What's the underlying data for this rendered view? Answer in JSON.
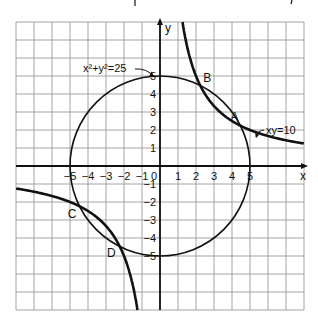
{
  "chart_data": {
    "type": "line",
    "title": "",
    "xlabel": "x",
    "ylabel": "y",
    "xlim": [
      -8,
      8
    ],
    "ylim": [
      -8,
      8
    ],
    "grid": true,
    "x_ticks": [
      "-5",
      "-4",
      "-3",
      "-2",
      "-1",
      "0",
      "1",
      "2",
      "3",
      "4",
      "5"
    ],
    "y_ticks": [
      "5",
      "4",
      "3",
      "2",
      "1",
      "-1",
      "-2",
      "-3",
      "-4",
      "-5"
    ],
    "series": [
      {
        "name": "x² + y² = 25",
        "kind": "circle",
        "center": [
          0,
          0
        ],
        "radius": 5
      },
      {
        "name": "xy = 10",
        "kind": "hyperbola",
        "k": 10
      }
    ],
    "annotations": [
      {
        "label": "A",
        "x": 4.47,
        "y": 2.24
      },
      {
        "label": "B",
        "x": 2.24,
        "y": 4.47
      },
      {
        "label": "C",
        "x": -4.47,
        "y": -2.24
      },
      {
        "label": "D",
        "x": -2.24,
        "y": -4.47
      }
    ],
    "curve_labels": {
      "circle": "x²+y²=25",
      "hyperbola": "xy=10"
    }
  }
}
